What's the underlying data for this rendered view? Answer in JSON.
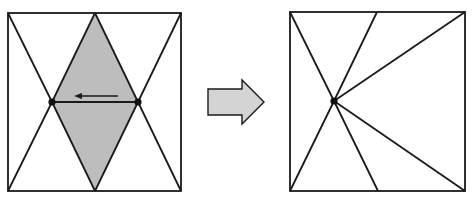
{
  "diagram": {
    "colors": {
      "stroke": "#1a1a1a",
      "shaded_region": "#bdbdbd",
      "arrow_fill": "#d4d4d4",
      "background": "#ffffff",
      "vertex": "#111111"
    },
    "before": {
      "label": "before",
      "square": {
        "x1": 8,
        "y1": 13,
        "x2": 181,
        "y2": 191
      },
      "shaded_diamond": [
        [
          95,
          13
        ],
        [
          138,
          102
        ],
        [
          95,
          191
        ],
        [
          52,
          102
        ]
      ],
      "vertices": [
        [
          52,
          102
        ],
        [
          138,
          102
        ]
      ],
      "collapse_arrow": {
        "from": [
          128,
          94
        ],
        "to": [
          78,
          94
        ]
      }
    },
    "transition_arrow": {
      "points": [
        [
          208,
          89
        ],
        [
          242,
          89
        ],
        [
          242,
          80
        ],
        [
          264,
          102
        ],
        [
          242,
          124
        ],
        [
          242,
          115
        ],
        [
          208,
          115
        ]
      ]
    },
    "after": {
      "label": "after",
      "square": {
        "x1": 290,
        "y1": 12,
        "x2": 465,
        "y2": 191
      },
      "hub_vertex": [
        334,
        101
      ],
      "spokes": [
        [
          290,
          12
        ],
        [
          377,
          12
        ],
        [
          465,
          12
        ],
        [
          290,
          191
        ],
        [
          378,
          191
        ],
        [
          465,
          191
        ]
      ]
    }
  }
}
